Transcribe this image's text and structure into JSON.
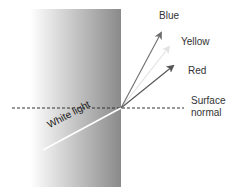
{
  "diagram": {
    "labels": {
      "blue": "Blue",
      "yellow": "Yellow",
      "red": "Red",
      "surface_normal_line1": "Surface",
      "surface_normal_line2": "normal",
      "incident": "White light"
    },
    "colors": {
      "block_dark": "#8c8c8c",
      "block_light": "#ffffff",
      "blue_ray": "#6e6e6e",
      "yellow_ray": "#e2e2e2",
      "red_ray": "#555555",
      "incident_ray": "#ffffff",
      "normal_line": "#333333"
    }
  }
}
